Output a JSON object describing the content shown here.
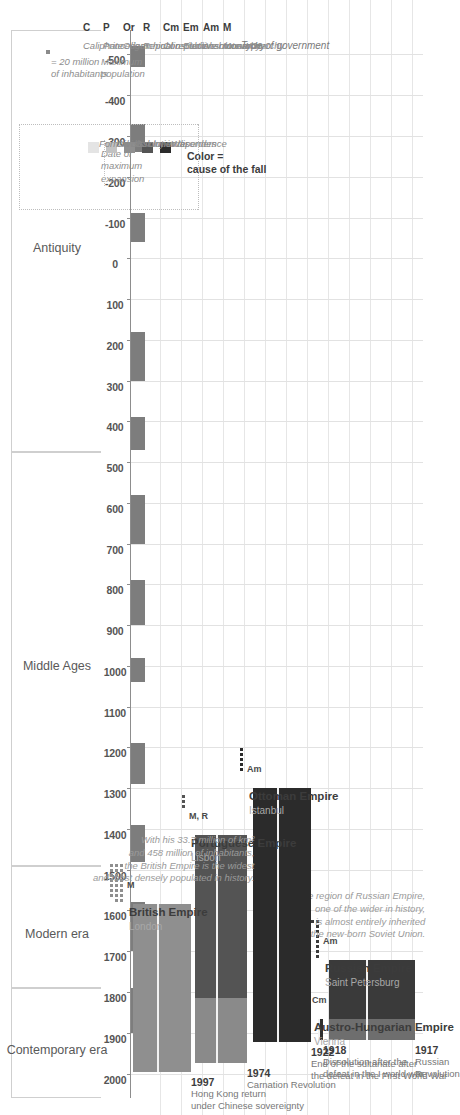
{
  "chart_data": {
    "type": "timeline",
    "xlabel": "",
    "ylabel": "",
    "axis": {
      "min": -560,
      "max": 2060,
      "ticks": [
        -500,
        -400,
        -300,
        -200,
        -100,
        0,
        100,
        200,
        300,
        400,
        500,
        600,
        700,
        800,
        900,
        1000,
        1100,
        1200,
        1300,
        1400,
        1500,
        1600,
        1700,
        1800,
        1900,
        2000
      ],
      "tick_labels": [
        "-500",
        "-400",
        "-300",
        "-200",
        "-100",
        "0",
        "100",
        "200",
        "300",
        "400",
        "500",
        "600",
        "700",
        "800",
        "900",
        "1000",
        "1100",
        "1200",
        "1300",
        "1400",
        "1500",
        "1600",
        "1700",
        "1800",
        "1900",
        "2000"
      ]
    },
    "eras": [
      {
        "label": "Antiquity",
        "start": -560,
        "end": 476
      },
      {
        "label": "Middle Ages",
        "start": 476,
        "end": 1492
      },
      {
        "label": "Modern era",
        "start": 1492,
        "end": 1789
      },
      {
        "label": "Contemporary era",
        "start": 1789,
        "end": 2060
      }
    ],
    "empires": [
      {
        "name": "Russian Empire",
        "capital": "Saint Petersburg",
        "start": 1721,
        "end": 1917,
        "fall_year": "1917",
        "fall_cause_text": "Russian\nRevolution",
        "fall_color": "#3a3a3a",
        "expansion_color": "#6e6e6e",
        "expansion_year": 1866,
        "government": "Am",
        "population_units": 9,
        "note": "The region of Russian Empire,\none of the wider in history,\nis almost entirely inherited\nfrom the new-born Soviet Union."
      },
      {
        "name": "Austro-Hungarian Empire",
        "capital": "Vienna",
        "start": 1867,
        "end": 1918,
        "fall_year": "1918",
        "fall_cause_text": "Dissolution after the\ndefeat in the I world war",
        "fall_color": "#2f2f2f",
        "expansion_color": "#2f2f2f",
        "expansion_year": 1900,
        "government": "Cm",
        "population_units": 3,
        "note": ""
      },
      {
        "name": "Ottoman Empire",
        "capital": "Istanbul",
        "start": 1299,
        "end": 1922,
        "fall_year": "1922",
        "fall_cause_text": "End of the sultanate after\nthe defeat in the First World War",
        "fall_color": "#2b2b2b",
        "expansion_color": "#2b2b2b",
        "expansion_year": 1683,
        "government": "Am",
        "population_units": 5,
        "note": ""
      },
      {
        "name": "Portuguese Empire",
        "capital": "Lisbon",
        "start": 1415,
        "end": 1974,
        "fall_year": "1974",
        "fall_cause_text": "Carnation Revolution",
        "fall_color": "#545454",
        "expansion_color": "#8a8a8a",
        "expansion_year": 1815,
        "government": "M, R",
        "population_units": 3,
        "note": ""
      },
      {
        "name": "British Empire",
        "capital": "London",
        "start": 1583,
        "end": 1997,
        "fall_year": "1997",
        "fall_cause_text": "Hong Kong return\nunder Chinese sovereignty",
        "fall_color": "#8f8f8f",
        "expansion_color": "#8f8f8f",
        "expansion_year": 1920,
        "government": "M",
        "population_units": 23,
        "note": "With his 33.7 million of km²\nand 458 million of inhabitants,\nthe British Empire is the widest\nand most densely populated in history."
      }
    ]
  },
  "legend": {
    "expansion": {
      "line1": "Date of",
      "line2": "maximum",
      "line3": "expansion"
    },
    "population": {
      "line1": "Maximum",
      "line2": "population",
      "unit": "= 20 million",
      "unit2": "of inhabitants"
    },
    "color_key": {
      "title_l1": "Color =",
      "title_l2": "cause of the fall",
      "items": [
        {
          "label": "War",
          "color": "#2b2b2b"
        },
        {
          "label": "Inner disorders",
          "color": "#545454"
        },
        {
          "label": "Colony independence",
          "color": "#8f8f8f"
        },
        {
          "label": "Division",
          "color": "#c2c2c2"
        },
        {
          "label": "Formal dissolution",
          "color": "#e4e4e4"
        }
      ]
    },
    "government": {
      "heading": "Type of government",
      "items": [
        {
          "key": "M",
          "value": "Monarchy"
        },
        {
          "key": "Am",
          "value": "Absolute monarchy"
        },
        {
          "key": "Em",
          "value": "Elective monarchy"
        },
        {
          "key": "Cm",
          "value": "Constitutional monarchy"
        },
        {
          "key": "R",
          "value": "Republic"
        },
        {
          "key": "Or",
          "value": "Oligarchical republic"
        },
        {
          "key": "P",
          "value": "Princedom"
        },
        {
          "key": "C",
          "value": "Caliphate"
        }
      ]
    }
  }
}
